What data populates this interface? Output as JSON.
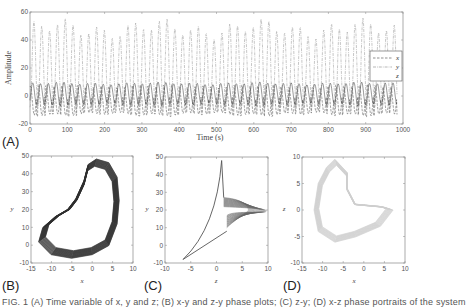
{
  "panels": [
    "(A)",
    "(B)",
    "(C)",
    "(D)"
  ],
  "caption": "FIG. 1 (A) Time variable of x, y and z; (B) x-y and z-y phase plots; (C) z-y; (D) x-z phase portraits of the system",
  "chart_data": [
    {
      "type": "line",
      "panel": "(A)",
      "title": "",
      "xlabel": "Time (s)",
      "ylabel": "Amplitude",
      "xlim": [
        0,
        1000
      ],
      "ylim": [
        -20,
        60
      ],
      "xticks": [
        0,
        100,
        200,
        300,
        400,
        500,
        600,
        700,
        800,
        900,
        1000
      ],
      "yticks": [
        -20,
        0,
        20,
        40,
        60
      ],
      "grid": false,
      "legend": {
        "position": "right-center",
        "entries": [
          "x",
          "y",
          "z"
        ],
        "styles": [
          "dashed",
          "dash-dot",
          "solid"
        ]
      },
      "period_s": 21,
      "series": [
        {
          "name": "x",
          "style": "dashed",
          "min": -13,
          "max": 7
        },
        {
          "name": "y",
          "style": "dash-dot",
          "min": -8,
          "max": 48
        },
        {
          "name": "z",
          "style": "solid",
          "min": -6,
          "max": 9
        }
      ]
    },
    {
      "type": "scatter",
      "panel": "(B)",
      "xlabel": "x",
      "ylabel": "y",
      "xlim": [
        -15,
        10
      ],
      "ylim": [
        -10,
        50
      ],
      "xticks": [
        -15,
        -10,
        -5,
        0,
        5,
        10
      ],
      "yticks": [
        -10,
        0,
        10,
        20,
        30,
        40,
        50
      ],
      "color": "#333333",
      "description": "dense closed attractor loop",
      "outline": [
        [
          1,
          48
        ],
        [
          4,
          46
        ],
        [
          6,
          38
        ],
        [
          6.5,
          25
        ],
        [
          6,
          12
        ],
        [
          4,
          0
        ],
        [
          0,
          -5
        ],
        [
          -5,
          -7
        ],
        [
          -10,
          -5
        ],
        [
          -13,
          2
        ],
        [
          -12,
          10
        ],
        [
          -9,
          16
        ],
        [
          -6,
          20
        ],
        [
          -4,
          26
        ],
        [
          -2,
          36
        ],
        [
          -1,
          45
        ],
        [
          1,
          48
        ]
      ]
    },
    {
      "type": "scatter",
      "panel": "(C)",
      "xlabel": "z",
      "ylabel": "y",
      "xlim": [
        -10,
        10
      ],
      "ylim": [
        -10,
        50
      ],
      "xticks": [
        -10,
        -5,
        0,
        5,
        10
      ],
      "yticks": [
        -10,
        0,
        10,
        20,
        30,
        40,
        50
      ],
      "color": "#555555",
      "description": "cusp shaped attractor, spike near z=1 up to y=48, fan to z=9 at y~20",
      "outline": [
        [
          -6.5,
          -8
        ],
        [
          -3,
          2
        ],
        [
          -0.5,
          15
        ],
        [
          0.5,
          30
        ],
        [
          1,
          48
        ],
        [
          1.3,
          30
        ],
        [
          2,
          26
        ],
        [
          8,
          24
        ],
        [
          9.5,
          21
        ],
        [
          8,
          17
        ],
        [
          4,
          12
        ],
        [
          2,
          7
        ],
        [
          0,
          3
        ],
        [
          -4,
          -4
        ],
        [
          -6.5,
          -8
        ]
      ]
    },
    {
      "type": "scatter",
      "panel": "(D)",
      "xlabel": "x",
      "ylabel": "z",
      "xlim": [
        -15,
        10
      ],
      "ylim": [
        -10,
        10
      ],
      "xticks": [
        -15,
        -10,
        -5,
        0,
        5,
        10
      ],
      "yticks": [
        -10,
        -5,
        0,
        5,
        10
      ],
      "color": "#c8c8c8",
      "description": "light grey crescent attractor",
      "outline": [
        [
          -7,
          9.5
        ],
        [
          -4,
          7
        ],
        [
          -4,
          4
        ],
        [
          -2,
          1
        ],
        [
          5,
          0.5
        ],
        [
          7,
          0
        ],
        [
          4,
          -3
        ],
        [
          -2,
          -5
        ],
        [
          -7,
          -6
        ],
        [
          -11,
          -4
        ],
        [
          -12,
          0
        ],
        [
          -11,
          5
        ],
        [
          -9,
          8
        ],
        [
          -7,
          9.5
        ]
      ]
    }
  ]
}
